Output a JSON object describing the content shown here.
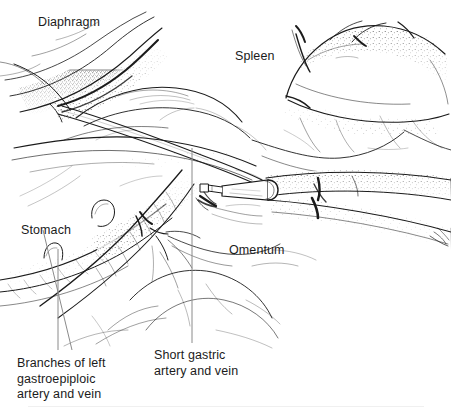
{
  "figure": {
    "kind": "anatomical-line-illustration",
    "background_color": "#ffffff",
    "ink_color": "#1b1b1b",
    "leader_line_color": "#808080",
    "width": 451,
    "height": 415
  },
  "labels": {
    "diaphragm": "Diaphragm",
    "spleen": "Spleen",
    "stomach": "Stomach",
    "omentum": "Omentum",
    "branches_gastroepiploic": "Branches of left\ngastroepiploic\nartery and vein",
    "short_gastric": "Short gastric\nartery and vein"
  },
  "leader_lines": [
    {
      "name": "branches-gastroepiploic-leader-vertical",
      "x1": 58,
      "y1": 249,
      "x2": 58,
      "y2": 350
    },
    {
      "name": "branches-gastroepiploic-leader-diagonal",
      "x1": 72,
      "y1": 350,
      "x2": 43,
      "y2": 230
    },
    {
      "name": "short-gastric-leader",
      "x1": 192,
      "y1": 148,
      "x2": 192,
      "y2": 343
    }
  ],
  "instrument": {
    "name": "laparoscopic cannula and probe",
    "shaft_label": "probe shaft",
    "cannula_label": "cannula hub"
  },
  "anatomy_parts": [
    "diaphragm",
    "spleen",
    "stomach",
    "omentum",
    "short gastric artery and vein",
    "branches of left gastroepiploic artery and vein"
  ]
}
